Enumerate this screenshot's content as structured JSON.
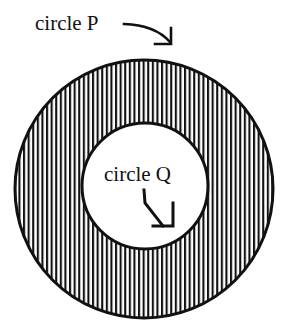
{
  "diagram": {
    "labels": {
      "outer": "circle P",
      "inner": "circle Q"
    },
    "colors": {
      "stroke": "#111111",
      "hatch": "#111111",
      "background": "#ffffff"
    },
    "shapes": {
      "outer_circle": {
        "cx": 144,
        "cy": 189,
        "r": 129
      },
      "inner_circle": {
        "cx": 145,
        "cy": 186,
        "r": 63
      },
      "hatch_pattern": "vertical-lines"
    }
  }
}
